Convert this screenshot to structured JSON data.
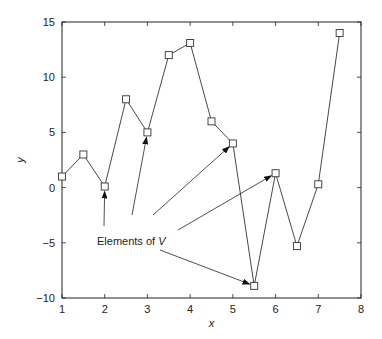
{
  "chart_data": {
    "type": "line",
    "title": "",
    "xlabel": "x",
    "ylabel": "y",
    "xlim": [
      1,
      8
    ],
    "ylim": [
      -10,
      15
    ],
    "xticks": [
      1,
      2,
      3,
      4,
      5,
      6,
      7,
      8
    ],
    "yticks": [
      -10,
      -5,
      0,
      5,
      10,
      15
    ],
    "grid": false,
    "marker": "square",
    "series": [
      {
        "name": "V",
        "x": [
          1,
          1.5,
          2,
          2.5,
          3,
          3.5,
          4,
          4.5,
          5,
          5.5,
          6,
          6.5,
          7,
          7.5
        ],
        "y": [
          1,
          3,
          0.1,
          8,
          5,
          12,
          13.1,
          6,
          4,
          -8.9,
          1.3,
          -5.3,
          0.3,
          14
        ]
      }
    ],
    "annotations": [
      {
        "text_prefix": "Elements of ",
        "text_var": "V",
        "arrows_to": [
          [
            2,
            0.1
          ],
          [
            3,
            5
          ],
          [
            5,
            4
          ],
          [
            6,
            1.3
          ],
          [
            5.5,
            -8.9
          ]
        ]
      }
    ]
  }
}
